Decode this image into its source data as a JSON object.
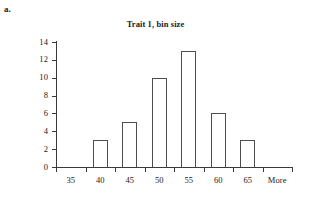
{
  "panel": {
    "label": "a."
  },
  "chart_data": {
    "type": "bar",
    "title": "Trait 1, bin size",
    "xlabel": "",
    "ylabel": "Frequency",
    "categories": [
      "35",
      "40",
      "45",
      "50",
      "55",
      "60",
      "65",
      "More"
    ],
    "values": [
      0,
      3,
      5,
      10,
      13,
      6,
      3,
      0
    ],
    "ylim": [
      0,
      14
    ],
    "ytick_step": 2,
    "yticks": [
      "0",
      "2",
      "4",
      "6",
      "8",
      "10",
      "12",
      "14"
    ],
    "grid": false,
    "legend": false,
    "bar_fill": "#ffffff",
    "bar_outline": "#4d4d4d",
    "axis_color": "#3a3a3a"
  }
}
